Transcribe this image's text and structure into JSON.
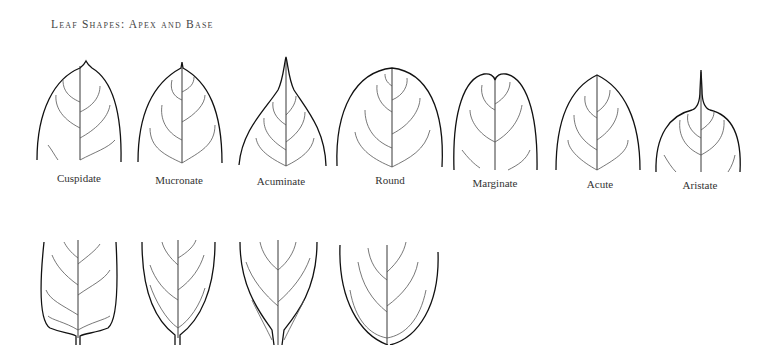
{
  "title": "Leaf Shapes: Apex and Base",
  "apex_shapes": [
    {
      "label": "Cuspidate"
    },
    {
      "label": "Mucronate"
    },
    {
      "label": "Acuminate"
    },
    {
      "label": "Round"
    },
    {
      "label": "Marginate"
    },
    {
      "label": "Acute"
    },
    {
      "label": "Aristate"
    }
  ],
  "base_shapes_count": 4
}
